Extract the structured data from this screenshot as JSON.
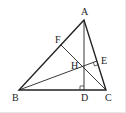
{
  "diagram": {
    "type": "triangle-orthocenter",
    "points": {
      "A": {
        "label": "A",
        "x": 84,
        "y": 20,
        "lx": 81,
        "ly": 15
      },
      "B": {
        "label": "B",
        "x": 19,
        "y": 90,
        "lx": 12,
        "ly": 101
      },
      "C": {
        "label": "C",
        "x": 106,
        "y": 90,
        "lx": 105,
        "ly": 101
      },
      "D": {
        "label": "D",
        "x": 84,
        "y": 90,
        "lx": 81,
        "ly": 101
      },
      "E": {
        "label": "E",
        "x": 97,
        "y": 61,
        "lx": 101,
        "ly": 64
      },
      "F": {
        "label": "F",
        "x": 61,
        "y": 45,
        "lx": 55,
        "ly": 43
      },
      "H": {
        "label": "H",
        "x": 84,
        "y": 67,
        "lx": 71,
        "ly": 69
      }
    },
    "segments": [
      {
        "from": "A",
        "to": "B",
        "weight": "thick"
      },
      {
        "from": "B",
        "to": "C",
        "weight": "thick"
      },
      {
        "from": "C",
        "to": "A",
        "weight": "thick"
      },
      {
        "from": "A",
        "to": "D",
        "weight": "thin"
      },
      {
        "from": "B",
        "to": "E",
        "weight": "thin"
      },
      {
        "from": "C",
        "to": "F",
        "weight": "thin"
      }
    ],
    "right_angles": [
      "D",
      "E"
    ],
    "colors": {
      "line": "#222222",
      "label": "#222222",
      "frame": "#e6e6e6"
    }
  }
}
